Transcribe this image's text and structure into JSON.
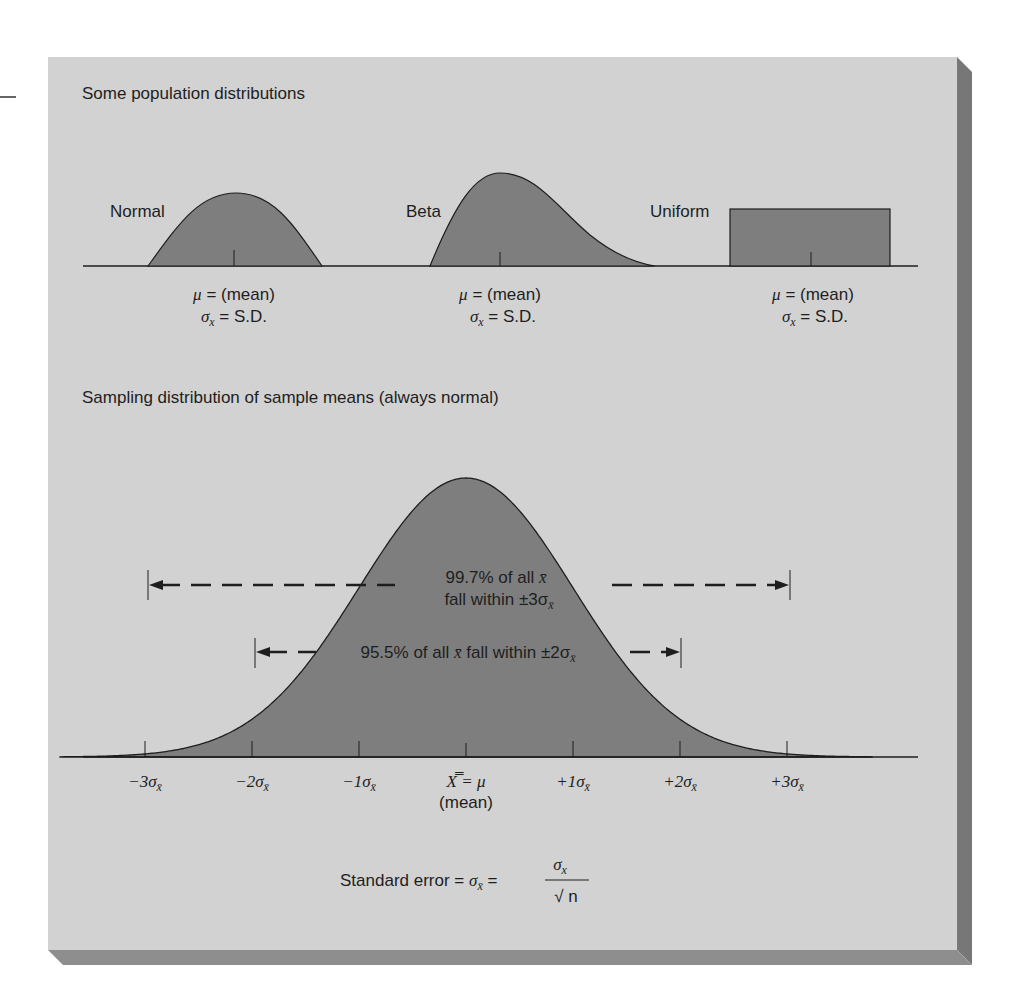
{
  "colors": {
    "page_bg": "#ffffff",
    "panel_bg": "#d2d2d2",
    "shadow_right": "#7a7a7a",
    "shadow_bottom": "#8c8c8c",
    "curve_fill": "#7e7e7e",
    "stroke": "#1e1e1e"
  },
  "top_section": {
    "title": "Some population distributions",
    "distributions": [
      {
        "name": "Normal",
        "mean_label": "μ = (mean)",
        "sd_label_sym": "σ",
        "sd_label_sub": "x",
        "sd_label_rest": " = S.D."
      },
      {
        "name": "Beta",
        "mean_label": "μ = (mean)",
        "sd_label_sym": "σ",
        "sd_label_sub": "x",
        "sd_label_rest": " = S.D."
      },
      {
        "name": "Uniform",
        "mean_label": "μ = (mean)",
        "sd_label_sym": "σ",
        "sd_label_sub": "x",
        "sd_label_rest": " = S.D."
      }
    ]
  },
  "bottom_section": {
    "title": "Sampling distribution of sample means (always normal)",
    "annotations": {
      "range3_line1": "99.7% of all x̄",
      "range3_line2": "fall within ±3σ",
      "range3_sub": "x̄",
      "range2_text": "95.5% of all x̄ fall within ±2σ",
      "range2_sub": "x̄"
    },
    "axis_ticks": [
      {
        "label": "−3σ",
        "sub": "x̄"
      },
      {
        "label": "−2σ",
        "sub": "x̄"
      },
      {
        "label": "−1σ",
        "sub": "x̄"
      },
      {
        "label": "X̿ = μ",
        "sub": ""
      },
      {
        "label": "+1σ",
        "sub": "x̄"
      },
      {
        "label": "+2σ",
        "sub": "x̄"
      },
      {
        "label": "+3σ",
        "sub": "x̄"
      }
    ],
    "mean_caption": "(mean)",
    "formula": {
      "prefix": "Standard error = ",
      "sigma": "σ",
      "sub_xbar": "x̄",
      "equals": " = ",
      "numerator": "σ",
      "numerator_sub": "x",
      "denominator": "√ n"
    }
  },
  "chart_data": {
    "type": "area",
    "title": "Sampling distribution of sample means (always normal)",
    "population_distributions": [
      "Normal",
      "Beta",
      "Uniform"
    ],
    "x": [
      -3,
      -2,
      -1,
      0,
      1,
      2,
      3
    ],
    "xtick_labels": [
      "−3σx̄",
      "−2σx̄",
      "−1σx̄",
      "X̿ = μ (mean)",
      "+1σx̄",
      "+2σx̄",
      "+3σx̄"
    ],
    "intervals": [
      {
        "range": [
          -3,
          3
        ],
        "percent": 99.7,
        "label": "99.7% of all x̄ fall within ±3σx̄"
      },
      {
        "range": [
          -2,
          2
        ],
        "percent": 95.5,
        "label": "95.5% of all x̄ fall within ±2σx̄"
      }
    ],
    "formula": "Standard error = σx̄ = σx / √n",
    "grid": false
  }
}
